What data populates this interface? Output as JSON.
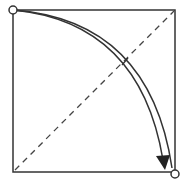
{
  "diagram": {
    "type": "fold-diagram",
    "colors": {
      "stroke": "#333333",
      "background": "#ffffff"
    },
    "square": {
      "x1": 13,
      "y1": 10,
      "x2": 175,
      "y2": 172
    },
    "diagonal": {
      "x1": 14,
      "y1": 171,
      "x2": 174,
      "y2": 11,
      "style": "dashed"
    },
    "start_point": {
      "x": 13,
      "y": 10,
      "marker": "circle"
    },
    "end_point": {
      "x": 174,
      "y": 174,
      "marker": "circle"
    },
    "arrow": {
      "from": "top-left-corner",
      "to": "bottom-right-corner",
      "head": "filled"
    }
  }
}
